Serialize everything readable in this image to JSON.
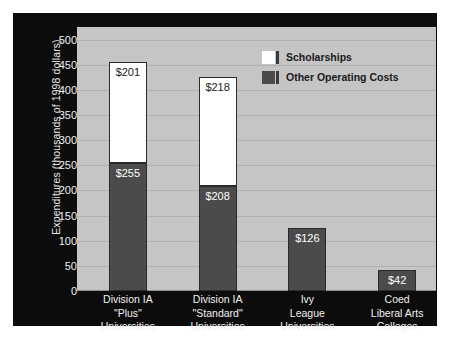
{
  "chart_data": {
    "type": "bar",
    "stacked": true,
    "title": "",
    "xlabel": "",
    "ylabel": "Expenditures (thousands of 1998 dollars)",
    "ylim": [
      0,
      525
    ],
    "yticks": [
      0,
      50,
      100,
      150,
      200,
      250,
      300,
      350,
      400,
      450,
      500
    ],
    "grid": true,
    "legend_position": "top-right",
    "categories": [
      "Division IA \"Plus\" Universities",
      "Division IA \"Standard\" Universities",
      "Ivy League Universities",
      "Coed Liberal Arts Colleges"
    ],
    "category_lines": [
      [
        "Division IA",
        "\"Plus\"",
        "Universities"
      ],
      [
        "Division IA",
        "\"Standard\"",
        "Universities"
      ],
      [
        "Ivy",
        "League",
        "Universities"
      ],
      [
        "Coed",
        "Liberal Arts",
        "Colleges"
      ]
    ],
    "series": [
      {
        "name": "Other Operating Costs",
        "color": "#4b4b4b",
        "values": [
          255,
          208,
          126,
          42
        ],
        "labels": [
          "$255",
          "$208",
          "$126",
          "$42"
        ]
      },
      {
        "name": "Scholarships",
        "color": "#ffffff",
        "values": [
          201,
          218,
          0,
          0
        ],
        "labels": [
          "$201",
          "$218",
          "",
          ""
        ]
      }
    ],
    "totals": [
      456,
      426,
      126,
      42
    ]
  },
  "legend": {
    "items": [
      {
        "label": "Scholarships",
        "swatch": "#ffffff"
      },
      {
        "label": "Other Operating Costs",
        "swatch": "#4b4b4b"
      }
    ]
  },
  "axis": {
    "tick_labels": [
      "500",
      "450",
      "400",
      "350",
      "300",
      "250",
      "200",
      "150",
      "100",
      "50",
      "0"
    ]
  },
  "colors": {
    "panel_background": "#0c0c0c",
    "plot_background": "#c5c5c5",
    "gridline": "#b0b0b0",
    "bar_dark": "#4b4b4b",
    "bar_light": "#ffffff",
    "tick_text": "#f0f0f0"
  }
}
